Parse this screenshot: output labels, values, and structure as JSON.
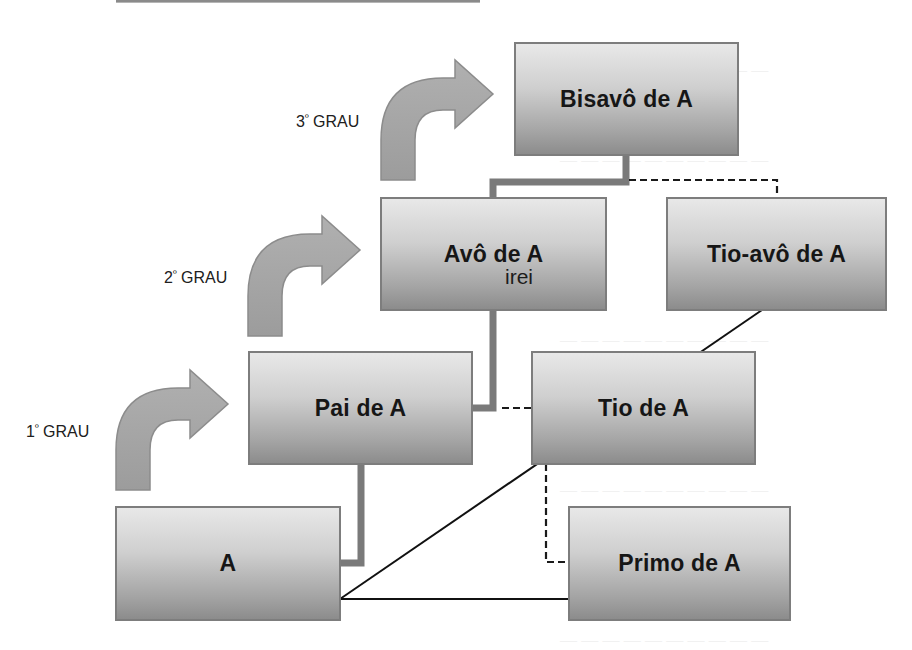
{
  "colors": {
    "box_top": "#e8e8e8",
    "box_bottom": "#8c8c8c",
    "box_border": "#7d7d7d",
    "arrow_fill": "#a6a6a6",
    "thick_connector": "#7a7a7a",
    "thin_line": "#111111",
    "text": "#161616"
  },
  "nodes": {
    "bisavo": {
      "label": "Bisavô de A"
    },
    "avo": {
      "label": "Avô de A",
      "overlay_text": "irei"
    },
    "tio_avo": {
      "label": "Tio-avô de A"
    },
    "pai": {
      "label": "Pai de A"
    },
    "tio": {
      "label": "Tio de A"
    },
    "a": {
      "label": "A"
    },
    "primo": {
      "label": "Primo de A"
    }
  },
  "degrees": [
    {
      "number": "1",
      "ordinal": "º",
      "word": "GRAU"
    },
    {
      "number": "2",
      "ordinal": "º",
      "word": "GRAU"
    },
    {
      "number": "3",
      "ordinal": "º",
      "word": "GRAU"
    }
  ],
  "connectors": [
    {
      "from": "A",
      "to": "Pai de A",
      "style": "thick-solid"
    },
    {
      "from": "Pai de A",
      "to": "Avô de A",
      "style": "thick-solid"
    },
    {
      "from": "Avô de A",
      "to": "Bisavô de A",
      "style": "thick-solid"
    },
    {
      "from": "Bisavô de A",
      "to": "Tio-avô de A",
      "style": "dashed"
    },
    {
      "from": "Pai de A",
      "to": "Tio de A",
      "style": "dashed"
    },
    {
      "from": "Tio de A",
      "to": "Primo de A",
      "style": "dashed"
    },
    {
      "from": "Tio-avô de A",
      "to": "A",
      "style": "thin-solid-diagonal"
    },
    {
      "from": "A",
      "to": "Primo de A",
      "style": "thin-solid"
    }
  ]
}
